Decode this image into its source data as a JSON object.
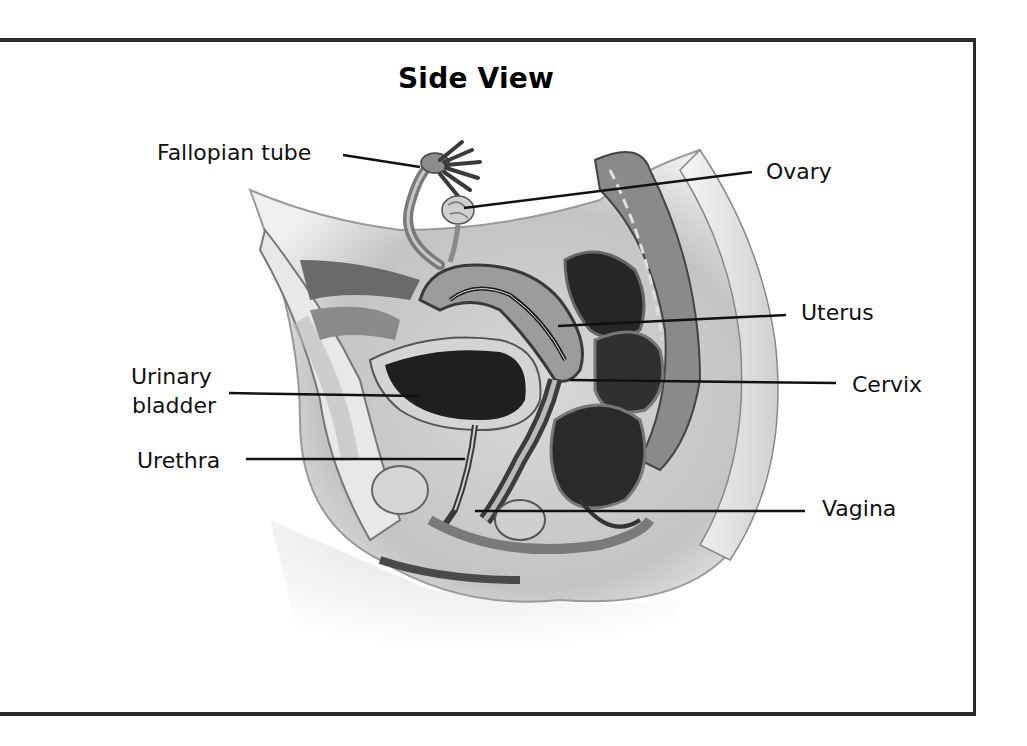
{
  "diagram": {
    "title": "Side View",
    "labels": [
      {
        "id": "fallopian-tube",
        "text": "Fallopian tube"
      },
      {
        "id": "ovary",
        "text": "Ovary"
      },
      {
        "id": "uterus",
        "text": "Uterus"
      },
      {
        "id": "cervix",
        "text": "Cervix"
      },
      {
        "id": "urinary-bladder",
        "text": "Urinary\nbladder",
        "line1": "Urinary",
        "line2": "bladder"
      },
      {
        "id": "urethra",
        "text": "Urethra"
      },
      {
        "id": "vagina",
        "text": "Vagina"
      }
    ]
  }
}
